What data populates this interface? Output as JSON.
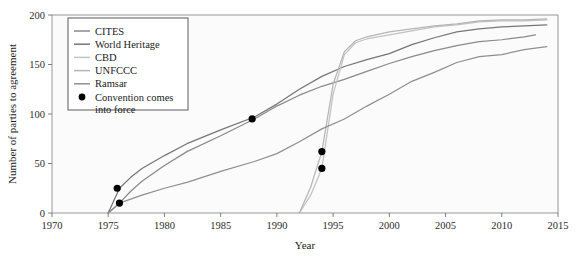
{
  "chart_data": {
    "type": "line",
    "title": "",
    "xlabel": "Year",
    "ylabel": "Number of parties to agreement",
    "xlim": [
      1970,
      2015
    ],
    "ylim": [
      0,
      200
    ],
    "xticks": [
      1970,
      1975,
      1980,
      1985,
      1990,
      1995,
      2000,
      2005,
      2010,
      2015
    ],
    "yticks": [
      0,
      50,
      100,
      150,
      200
    ],
    "grid": false,
    "legend_position": "top-left",
    "series": [
      {
        "name": "CITES",
        "color": "#8a8a8a",
        "x": [
          1975,
          1976,
          1977,
          1978,
          1980,
          1982,
          1985,
          1988,
          1990,
          1992,
          1994,
          1996,
          1998,
          2000,
          2002,
          2004,
          2006,
          2008,
          2010,
          2012,
          2013
        ],
        "y": [
          0,
          10,
          22,
          32,
          48,
          62,
          78,
          95,
          108,
          119,
          128,
          135,
          143,
          151,
          158,
          164,
          169,
          173,
          175,
          178,
          180
        ]
      },
      {
        "name": "World Heritage",
        "color": "#767676",
        "x": [
          1975,
          1976,
          1977,
          1978,
          1980,
          1982,
          1985,
          1988,
          1990,
          1992,
          1994,
          1996,
          1998,
          2000,
          2002,
          2004,
          2006,
          2008,
          2010,
          2012,
          2014
        ],
        "y": [
          0,
          25,
          36,
          45,
          58,
          70,
          84,
          97,
          110,
          125,
          138,
          148,
          155,
          161,
          170,
          177,
          183,
          186,
          188,
          189,
          190
        ]
      },
      {
        "name": "CBD",
        "color": "#c2c2c2",
        "x": [
          1992,
          1993,
          1994,
          1995,
          1996,
          1997,
          1998,
          2000,
          2002,
          2004,
          2006,
          2008,
          2010,
          2012,
          2014
        ],
        "y": [
          0,
          18,
          45,
          120,
          160,
          172,
          176,
          180,
          184,
          188,
          190,
          193,
          194,
          194,
          195
        ]
      },
      {
        "name": "UNFCCC",
        "color": "#b5b5b5",
        "x": [
          1992,
          1993,
          1994,
          1995,
          1996,
          1997,
          1998,
          2000,
          2002,
          2004,
          2006,
          2008,
          2010,
          2012,
          2014
        ],
        "y": [
          0,
          26,
          62,
          130,
          163,
          174,
          178,
          183,
          186,
          189,
          191,
          194,
          195,
          195,
          196
        ]
      },
      {
        "name": "Ramsar",
        "color": "#8f8f8f",
        "x": [
          1975,
          1976,
          1978,
          1980,
          1982,
          1985,
          1988,
          1990,
          1992,
          1994,
          1996,
          1998,
          2000,
          2002,
          2004,
          2006,
          2008,
          2010,
          2012,
          2014
        ],
        "y": [
          0,
          10,
          18,
          25,
          31,
          42,
          52,
          60,
          72,
          85,
          95,
          108,
          120,
          133,
          142,
          152,
          158,
          160,
          165,
          168
        ]
      }
    ],
    "force_points": {
      "label": "Convention comes into force",
      "color": "#000000",
      "points": [
        {
          "series": "World Heritage",
          "x": 1975.8,
          "y": 25
        },
        {
          "series": "CITES",
          "x": 1976.0,
          "y": 10
        },
        {
          "series": "Ramsar",
          "x": 1987.8,
          "y": 95
        },
        {
          "series": "UNFCCC",
          "x": 1994.0,
          "y": 62
        },
        {
          "series": "CBD",
          "x": 1994.0,
          "y": 45
        }
      ]
    }
  },
  "legend": {
    "entries": [
      {
        "label": "CITES"
      },
      {
        "label": "World Heritage"
      },
      {
        "label": "CBD"
      },
      {
        "label": "UNFCCC"
      },
      {
        "label": "Ramsar"
      }
    ],
    "force_label_line1": "Convention comes",
    "force_label_line2": "into force"
  }
}
